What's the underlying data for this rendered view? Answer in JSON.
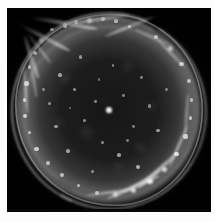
{
  "figure": {
    "subject_name": "supernova-remnant-shell",
    "description": "Monochrome astronomical image of a roughly circular supernova remnant showing a limb-brightened filamentary shell against a black sky background",
    "plate_background_color": "#000000",
    "paper_margin_color": "#fdfdfd",
    "emission_color": "#ffffff",
    "dimensions": {
      "image_width_px": 215,
      "image_height_px": 222,
      "plate_left_px": 7,
      "plate_top_px": 8,
      "plate_width_px": 204,
      "plate_height_px": 204
    }
  },
  "shell": {
    "center_x_pct": 50,
    "center_y_pct": 50,
    "radius_x_pct": 46,
    "radius_y_pct": 47,
    "brightest_sector": "upper-left",
    "second_brightest_sector": "lower-right",
    "faintest_sector": "mid-right",
    "interior": "dark mottled with scattered point sources"
  },
  "knots": [
    {
      "x": 22.0,
      "y": 10.5,
      "r": 0.9,
      "o": 0.8
    },
    {
      "x": 28.5,
      "y": 8.5,
      "r": 1.1,
      "o": 0.85
    },
    {
      "x": 34.0,
      "y": 7.0,
      "r": 1.0,
      "o": 0.75
    },
    {
      "x": 40.5,
      "y": 6.0,
      "r": 1.3,
      "o": 0.9
    },
    {
      "x": 47.0,
      "y": 5.5,
      "r": 1.0,
      "o": 0.78
    },
    {
      "x": 53.5,
      "y": 6.5,
      "r": 0.9,
      "o": 0.7
    },
    {
      "x": 60.0,
      "y": 9.0,
      "r": 0.8,
      "o": 0.62
    },
    {
      "x": 17.0,
      "y": 16.0,
      "r": 1.2,
      "o": 0.82
    },
    {
      "x": 13.5,
      "y": 22.0,
      "r": 1.0,
      "o": 0.74
    },
    {
      "x": 11.0,
      "y": 29.0,
      "r": 0.9,
      "o": 0.68
    },
    {
      "x": 9.5,
      "y": 37.0,
      "r": 1.1,
      "o": 0.72
    },
    {
      "x": 8.5,
      "y": 45.0,
      "r": 0.9,
      "o": 0.66
    },
    {
      "x": 9.0,
      "y": 53.0,
      "r": 1.0,
      "o": 0.7
    },
    {
      "x": 11.0,
      "y": 61.0,
      "r": 0.9,
      "o": 0.64
    },
    {
      "x": 14.5,
      "y": 69.0,
      "r": 1.1,
      "o": 0.7
    },
    {
      "x": 20.0,
      "y": 76.0,
      "r": 0.9,
      "o": 0.6
    },
    {
      "x": 27.0,
      "y": 82.0,
      "r": 1.0,
      "o": 0.62
    },
    {
      "x": 35.0,
      "y": 87.0,
      "r": 0.9,
      "o": 0.58
    },
    {
      "x": 44.0,
      "y": 90.5,
      "r": 1.0,
      "o": 0.6
    },
    {
      "x": 53.0,
      "y": 91.5,
      "r": 1.2,
      "o": 0.7
    },
    {
      "x": 62.0,
      "y": 89.5,
      "r": 1.3,
      "o": 0.8
    },
    {
      "x": 70.0,
      "y": 85.0,
      "r": 1.4,
      "o": 0.86
    },
    {
      "x": 77.0,
      "y": 79.0,
      "r": 1.2,
      "o": 0.82
    },
    {
      "x": 83.0,
      "y": 71.5,
      "r": 1.1,
      "o": 0.76
    },
    {
      "x": 87.5,
      "y": 63.0,
      "r": 1.0,
      "o": 0.7
    },
    {
      "x": 90.0,
      "y": 54.0,
      "r": 0.9,
      "o": 0.62
    },
    {
      "x": 90.5,
      "y": 45.0,
      "r": 0.9,
      "o": 0.58
    },
    {
      "x": 89.0,
      "y": 36.0,
      "r": 1.0,
      "o": 0.62
    },
    {
      "x": 85.5,
      "y": 27.5,
      "r": 1.1,
      "o": 0.68
    },
    {
      "x": 80.0,
      "y": 20.0,
      "r": 1.2,
      "o": 0.74
    },
    {
      "x": 73.0,
      "y": 14.0,
      "r": 1.0,
      "o": 0.7
    },
    {
      "x": 50.0,
      "y": 50.0,
      "r": 1.4,
      "o": 0.92
    },
    {
      "x": 43.5,
      "y": 46.0,
      "r": 0.7,
      "o": 0.48
    },
    {
      "x": 57.0,
      "y": 43.0,
      "r": 0.7,
      "o": 0.46
    },
    {
      "x": 38.0,
      "y": 55.0,
      "r": 0.8,
      "o": 0.5
    },
    {
      "x": 62.0,
      "y": 58.0,
      "r": 0.7,
      "o": 0.44
    },
    {
      "x": 33.0,
      "y": 40.0,
      "r": 0.8,
      "o": 0.52
    },
    {
      "x": 66.0,
      "y": 34.0,
      "r": 0.7,
      "o": 0.46
    },
    {
      "x": 47.0,
      "y": 66.0,
      "r": 0.8,
      "o": 0.5
    },
    {
      "x": 55.0,
      "y": 72.0,
      "r": 0.9,
      "o": 0.56
    },
    {
      "x": 30.0,
      "y": 70.0,
      "r": 0.9,
      "o": 0.54
    },
    {
      "x": 24.0,
      "y": 58.0,
      "r": 0.8,
      "o": 0.5
    },
    {
      "x": 21.0,
      "y": 47.0,
      "r": 0.8,
      "o": 0.48
    },
    {
      "x": 26.0,
      "y": 33.0,
      "r": 0.9,
      "o": 0.54
    },
    {
      "x": 36.0,
      "y": 24.0,
      "r": 0.8,
      "o": 0.5
    },
    {
      "x": 52.0,
      "y": 28.0,
      "r": 0.7,
      "o": 0.44
    },
    {
      "x": 70.0,
      "y": 48.0,
      "r": 0.8,
      "o": 0.48
    },
    {
      "x": 74.0,
      "y": 60.0,
      "r": 0.9,
      "o": 0.54
    },
    {
      "x": 64.0,
      "y": 78.0,
      "r": 1.0,
      "o": 0.62
    },
    {
      "x": 42.0,
      "y": 80.0,
      "r": 0.8,
      "o": 0.48
    },
    {
      "x": 18.0,
      "y": 40.0,
      "r": 0.7,
      "o": 0.44
    },
    {
      "x": 45.0,
      "y": 35.0,
      "r": 0.6,
      "o": 0.38
    },
    {
      "x": 59.0,
      "y": 65.0,
      "r": 0.7,
      "o": 0.42
    },
    {
      "x": 31.0,
      "y": 49.0,
      "r": 0.6,
      "o": 0.36
    },
    {
      "x": 78.0,
      "y": 40.0,
      "r": 0.7,
      "o": 0.42
    }
  ],
  "filaments": [
    {
      "x": 18.0,
      "y": 14.0,
      "w": 30.0,
      "h": 2.0,
      "rot": 28,
      "o": 0.8
    },
    {
      "x": 28.0,
      "y": 7.5,
      "w": 34.0,
      "h": 2.2,
      "rot": 10,
      "o": 0.88
    },
    {
      "x": 45.0,
      "y": 5.5,
      "w": 30.0,
      "h": 1.8,
      "rot": -8,
      "o": 0.76
    },
    {
      "x": 60.0,
      "y": 9.0,
      "w": 26.0,
      "h": 1.6,
      "rot": -22,
      "o": 0.66
    },
    {
      "x": 12.0,
      "y": 24.0,
      "w": 22.0,
      "h": 1.8,
      "rot": 72,
      "o": 0.72
    },
    {
      "x": 9.0,
      "y": 40.0,
      "w": 24.0,
      "h": 1.6,
      "rot": 86,
      "o": 0.66
    },
    {
      "x": 16.0,
      "y": 20.0,
      "w": 18.0,
      "h": 1.4,
      "rot": 52,
      "o": 0.58
    },
    {
      "x": 13.0,
      "y": 34.0,
      "w": 20.0,
      "h": 1.3,
      "rot": 80,
      "o": 0.52
    },
    {
      "x": 62.0,
      "y": 88.0,
      "w": 28.0,
      "h": 2.2,
      "rot": -24,
      "o": 0.84
    },
    {
      "x": 74.0,
      "y": 80.0,
      "w": 26.0,
      "h": 2.0,
      "rot": -42,
      "o": 0.8
    },
    {
      "x": 84.0,
      "y": 68.0,
      "w": 22.0,
      "h": 1.7,
      "rot": -66,
      "o": 0.7
    },
    {
      "x": 50.0,
      "y": 90.5,
      "w": 24.0,
      "h": 1.6,
      "rot": -8,
      "o": 0.66
    },
    {
      "x": 68.0,
      "y": 84.0,
      "w": 20.0,
      "h": 1.4,
      "rot": -32,
      "o": 0.62
    },
    {
      "x": 88.0,
      "y": 52.0,
      "w": 20.0,
      "h": 1.3,
      "rot": -86,
      "o": 0.5
    },
    {
      "x": 80.0,
      "y": 22.0,
      "w": 20.0,
      "h": 1.4,
      "rot": 46,
      "o": 0.56
    },
    {
      "x": 72.0,
      "y": 14.5,
      "w": 20.0,
      "h": 1.3,
      "rot": 24,
      "o": 0.52
    }
  ]
}
